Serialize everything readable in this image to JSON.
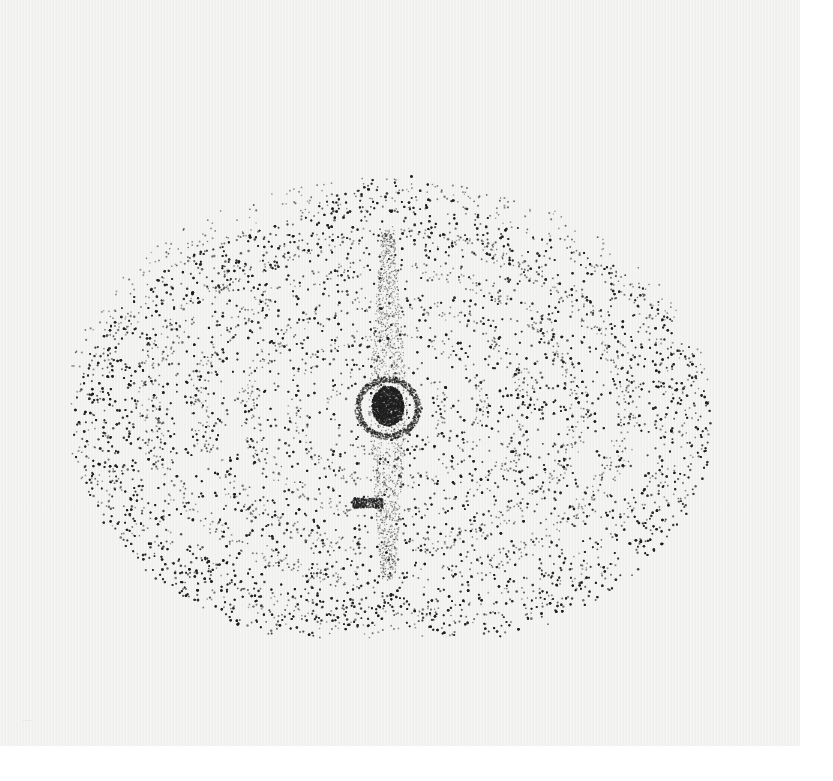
{
  "scene": {
    "description": "Photograph of a stippled dot drawing on off-white paper: a heart/apple-shaped outer form with nested concentric arc bands and a dark central core",
    "paper_color": "#f1f1f0",
    "ink_color": "#2a2a2a",
    "signature_text": "······"
  },
  "artwork": {
    "center": [
      388,
      408
    ],
    "outer_shape": {
      "peak": [
        382,
        178
      ],
      "bottom_notch": [
        390,
        600
      ],
      "left_extent": 73,
      "right_extent": 712,
      "top_y": 195,
      "bottom_y": 648
    },
    "bands": [
      {
        "rx": 300,
        "ry": 215,
        "width": 45,
        "density": 0.9
      },
      {
        "rx": 240,
        "ry": 172,
        "width": 25,
        "density": 1.4
      },
      {
        "rx": 190,
        "ry": 140,
        "width": 22,
        "density": 1.6
      },
      {
        "rx": 140,
        "ry": 105,
        "width": 20,
        "density": 1.8
      },
      {
        "rx": 95,
        "ry": 75,
        "width": 16,
        "density": 2.0
      },
      {
        "rx": 55,
        "ry": 48,
        "width": 12,
        "density": 2.4
      }
    ],
    "core": {
      "radius": 20,
      "color": "#1c1c1c"
    }
  }
}
